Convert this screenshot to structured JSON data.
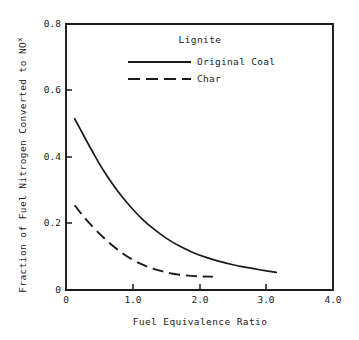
{
  "chart_data": {
    "type": "line",
    "title": "",
    "xlabel": "Fuel Equivalence Ratio",
    "ylabel": "Fraction of Fuel Nitrogen Converted to NO",
    "ylabel_subscript": "x",
    "xlim": [
      0,
      4.0
    ],
    "ylim": [
      0,
      0.8
    ],
    "grid": false,
    "legend_position": "top-center",
    "legend_title": "Lignite",
    "xticks": [
      "0",
      "1.0",
      "2.0",
      "3.0",
      "4.0"
    ],
    "xtick_values": [
      0,
      1.0,
      2.0,
      3.0,
      4.0
    ],
    "yticks": [
      "0",
      "0.2",
      "0.4",
      "0.6",
      "0.8"
    ],
    "ytick_values": [
      0,
      0.2,
      0.4,
      0.6,
      0.8
    ],
    "series": [
      {
        "name": "Original Coal",
        "style": "solid",
        "color": "#1a1a1a",
        "x": [
          0.13,
          0.25,
          0.4,
          0.55,
          0.7,
          0.85,
          1.0,
          1.15,
          1.3,
          1.5,
          1.7,
          1.9,
          2.1,
          2.3,
          2.5,
          2.7,
          2.9,
          3.15
        ],
        "y": [
          0.515,
          0.47,
          0.415,
          0.363,
          0.318,
          0.278,
          0.243,
          0.212,
          0.186,
          0.156,
          0.132,
          0.113,
          0.098,
          0.086,
          0.076,
          0.068,
          0.061,
          0.053
        ]
      },
      {
        "name": "Char",
        "style": "dashed",
        "color": "#1a1a1a",
        "x": [
          0.13,
          0.25,
          0.4,
          0.55,
          0.7,
          0.85,
          1.0,
          1.15,
          1.3,
          1.45,
          1.6,
          1.8,
          2.0,
          2.2
        ],
        "y": [
          0.255,
          0.224,
          0.19,
          0.16,
          0.133,
          0.11,
          0.091,
          0.076,
          0.064,
          0.056,
          0.049,
          0.044,
          0.041,
          0.04
        ]
      }
    ]
  },
  "legend": {
    "title": "Lignite",
    "entries": [
      {
        "label": "Original Coal",
        "style": "solid"
      },
      {
        "label": "Char",
        "style": "dashed"
      }
    ]
  },
  "axes": {
    "x_title": "Fuel Equivalence Ratio",
    "y_title": "Fraction of Fuel Nitrogen Converted to NO",
    "y_title_sub": "x",
    "x_tick_labels": [
      "0",
      "1.0",
      "2.0",
      "3.0",
      "4.0"
    ],
    "y_tick_labels": [
      "0",
      "0.2",
      "0.4",
      "0.6",
      "0.8"
    ]
  },
  "colors": {
    "background": "#ffffff",
    "ink": "#1a1a1a"
  }
}
